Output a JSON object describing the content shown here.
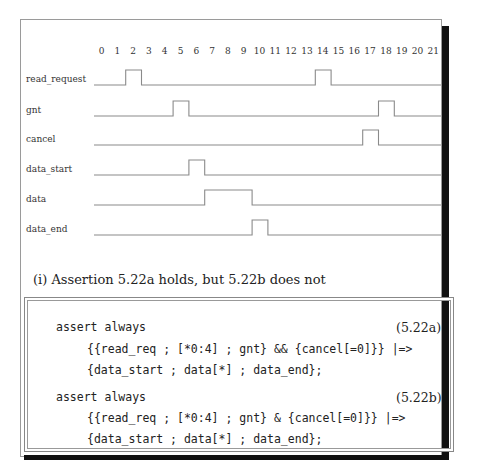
{
  "timing_diagram": {
    "ticks": [
      "0",
      "1",
      "2",
      "3",
      "4",
      "5",
      "6",
      "7",
      "8",
      "9",
      "10",
      "11",
      "12",
      "13",
      "14",
      "15",
      "16",
      "17",
      "18",
      "19",
      "20",
      "21"
    ],
    "signals": [
      {
        "name": "read_request",
        "high_cycles": [
          2,
          14
        ]
      },
      {
        "name": "gnt",
        "high_cycles": [
          5,
          18
        ]
      },
      {
        "name": "cancel",
        "high_cycles": [
          17
        ]
      },
      {
        "name": "data_start",
        "high_cycles": [
          6
        ]
      },
      {
        "name": "data",
        "high_cycles": [
          7,
          8,
          9
        ]
      },
      {
        "name": "data_end",
        "high_cycles": [
          10
        ]
      }
    ],
    "labels": {
      "read_request": "read_request",
      "gnt": "gnt",
      "cancel": "cancel",
      "data_start": "data_start",
      "data": "data",
      "data_end": "data_end"
    }
  },
  "caption": "(i) Assertion 5.22a holds, but 5.22b does not",
  "assertions": [
    {
      "line1": "assert always",
      "line2": "{{read_req ; [*0:4] ; gnt} && {cancel[=0]}} |=>",
      "line3": "{data_start ; data[*] ; data_end};",
      "number": "(5.22a)"
    },
    {
      "line1": "assert always",
      "line2": "{{read_req ; [*0:4] ; gnt} & {cancel[=0]}} |=>",
      "line3": "{data_start ; data[*] ; data_end};",
      "number": "(5.22b)"
    }
  ],
  "colors": {
    "waveform": "#8a8a8a",
    "frame_border": "#9a9a9a",
    "shadow": "#111111"
  }
}
